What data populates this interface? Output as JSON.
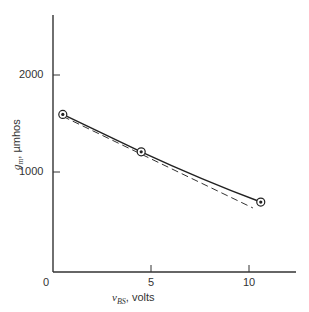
{
  "chart_data": {
    "type": "line",
    "title": "",
    "xlabel_symbol": "v",
    "xlabel_sub": "BS",
    "xlabel_unit": ", volts",
    "ylabel_symbol": "g",
    "ylabel_sub": "m",
    "ylabel_unit": ", µmhos",
    "xlim": [
      0,
      12.3
    ],
    "ylim": [
      0,
      2600
    ],
    "x_ticks": [
      0,
      5,
      10
    ],
    "x_tick_labels": [
      "0",
      "5",
      "10"
    ],
    "y_ticks": [
      1000,
      2000
    ],
    "y_tick_labels": [
      "1000",
      "2000"
    ],
    "grid": false,
    "series": [
      {
        "name": "measured",
        "style": "solid",
        "markers": "circle-dot",
        "x": [
          0.5,
          4.5,
          10.6
        ],
        "y": [
          1600,
          1220,
          710
        ]
      },
      {
        "name": "fit",
        "style": "dashed",
        "markers": "none",
        "x": [
          0.5,
          10.2
        ],
        "y": [
          1580,
          650
        ]
      }
    ]
  }
}
